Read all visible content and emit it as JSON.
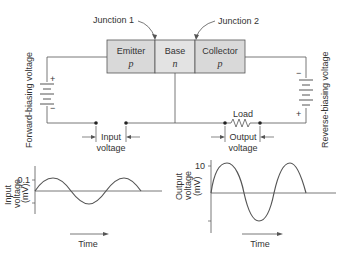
{
  "diagram": {
    "junctions": [
      "Junction 1",
      "Junction 2"
    ],
    "regions": [
      {
        "name": "Emitter",
        "type": "p"
      },
      {
        "name": "Base",
        "type": "n"
      },
      {
        "name": "Collector",
        "type": "p"
      }
    ],
    "left_side_label": "Forward-biasing voltage",
    "right_side_label": "Reverse-biasing voltage",
    "input_label_1": "Input",
    "input_label_2": "voltage",
    "output_label_1": "Output",
    "output_label_2": "voltage",
    "load_label": "Load",
    "battery_plus": "+",
    "battery_minus": "−",
    "colors": {
      "region_fill": "#d9d9d9",
      "line": "#555555"
    }
  },
  "graphs": {
    "input": {
      "ylabel_1": "Input",
      "ylabel_2": "voltage",
      "ylabel_3": "(mV)",
      "tick": "0.1",
      "xlabel": "Time"
    },
    "output": {
      "ylabel_1": "Output",
      "ylabel_2": "voltage",
      "ylabel_3": "(mV)",
      "tick": "10",
      "xlabel": "Time"
    }
  }
}
